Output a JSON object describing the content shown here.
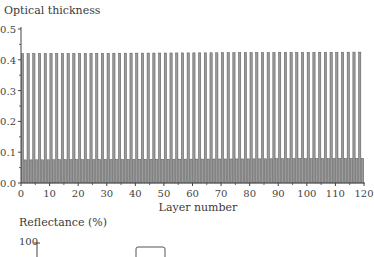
{
  "chart_data": [
    {
      "type": "bar",
      "title": "Optical thickness",
      "xlabel": "Layer number",
      "ylabel": "Optical thickness",
      "xlim": [
        0,
        120
      ],
      "ylim": [
        0,
        0.5
      ],
      "xticks": [
        0,
        10,
        20,
        30,
        40,
        50,
        60,
        70,
        80,
        90,
        100,
        110,
        120
      ],
      "yticks": [
        "0.0",
        "0.1",
        "0.2",
        "0.3",
        "0.4",
        "0.5"
      ],
      "grid": false,
      "description": "Alternating layer stack: odd layers high-index ~0.42 optical thickness, even layers ~0.075, both increasing slightly toward layer 120",
      "series": [
        {
          "name": "thick layers",
          "pattern": "odd layers",
          "start_value": 0.42,
          "end_value": 0.425
        },
        {
          "name": "thin layers",
          "pattern": "even layers",
          "start_value": 0.075,
          "end_value": 0.08
        }
      ],
      "n_layers": 120
    },
    {
      "type": "line",
      "title": "Reflectance (%)",
      "ylabel": "Reflectance (%)",
      "yticks": [
        "100"
      ],
      "note": "partially visible; only top of plot shown"
    }
  ],
  "top_chart": {
    "title": "Optical thickness",
    "xlabel": "Layer number",
    "xticks": [
      "0",
      "10",
      "20",
      "30",
      "40",
      "50",
      "60",
      "70",
      "80",
      "90",
      "100",
      "110",
      "120"
    ],
    "yticks": [
      "0.0",
      "0.1",
      "0.2",
      "0.3",
      "0.4",
      "0.5"
    ]
  },
  "bottom_chart": {
    "title": "Reflectance (%)",
    "ytick_top": "100"
  },
  "colors": {
    "bar_fill": "#9a9a9a",
    "bar_edge": "#555555",
    "axis": "#444444"
  }
}
